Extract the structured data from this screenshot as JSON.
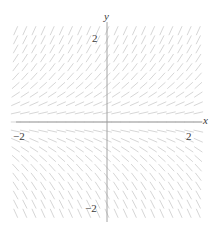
{
  "figure": {
    "kind": "slope-field",
    "title": "",
    "background_color": "#ffffff",
    "tick_color": "#3a3a3a",
    "axis_color": "#8c8c8c",
    "segment_color": "#cfcfcf"
  },
  "axes": {
    "x_label": "x",
    "y_label": "y",
    "x_ticks": [
      {
        "value": -2,
        "label": "−2"
      },
      {
        "value": 2,
        "label": "2"
      }
    ],
    "y_ticks": [
      {
        "value": 2,
        "label": "2"
      },
      {
        "value": -2,
        "label": "−2"
      }
    ],
    "xlim": [
      -2.35,
      2.35
    ],
    "ylim": [
      -2.35,
      2.35
    ],
    "grid": false,
    "origin_px": [
      107,
      122
    ],
    "scale_px_per_unit": 41.5
  },
  "chart_data": {
    "type": "scatter",
    "subtype": "slope-field",
    "title": "",
    "xlabel": "x",
    "ylabel": "y",
    "xlim": [
      -2.35,
      2.35
    ],
    "ylim": [
      -2.35,
      2.35
    ],
    "grid": false,
    "legend": null,
    "slope_rule": "slope = y",
    "sample_spacing": {
      "x": 0.22,
      "y": 0.22
    },
    "segment_length_px": 9,
    "x_samples": [
      -2.2,
      -1.98,
      -1.76,
      -1.54,
      -1.32,
      -1.1,
      -0.88,
      -0.66,
      -0.44,
      -0.22,
      0,
      0.22,
      0.44,
      0.66,
      0.88,
      1.1,
      1.32,
      1.54,
      1.76,
      1.98,
      2.2
    ],
    "y_samples": [
      2.2,
      1.98,
      1.76,
      1.54,
      1.32,
      1.1,
      0.88,
      0.66,
      0.44,
      0.22,
      0,
      -0.22,
      -0.44,
      -0.66,
      -0.88,
      -1.1,
      -1.32,
      -1.54,
      -1.76,
      -1.98,
      -2.2
    ],
    "slopes_by_y": [
      2.2,
      1.98,
      1.76,
      1.54,
      1.32,
      1.1,
      0.88,
      0.66,
      0.44,
      0.22,
      0,
      -0.22,
      -0.44,
      -0.66,
      -0.88,
      -1.1,
      -1.32,
      -1.54,
      -1.76,
      -1.98,
      -2.2
    ]
  }
}
